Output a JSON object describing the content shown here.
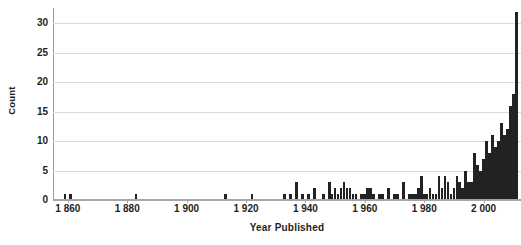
{
  "chart_data": {
    "type": "bar",
    "title": "",
    "xlabel": "Year Published",
    "ylabel": "Count",
    "grid": true,
    "legend": "none",
    "xlim": [
      1855,
      2012
    ],
    "ylim": [
      0,
      32
    ],
    "ytick_labels": [
      "0",
      "5",
      "10",
      "15",
      "20",
      "25",
      "30"
    ],
    "ytick_values": [
      0,
      5,
      10,
      15,
      20,
      25,
      30
    ],
    "xtick_labels": [
      "1 860",
      "1 880",
      "1 900",
      "1 920",
      "1 940",
      "1 960",
      "1 980",
      "2 000"
    ],
    "xtick_values": [
      1860,
      1880,
      1900,
      1920,
      1940,
      1960,
      1980,
      2000
    ],
    "bar_color": "#222222",
    "gridline_color": "#d9d9d9",
    "categories": [
      1858,
      1859,
      1860,
      1861,
      1862,
      1863,
      1864,
      1865,
      1866,
      1867,
      1868,
      1869,
      1870,
      1871,
      1872,
      1873,
      1874,
      1875,
      1876,
      1877,
      1878,
      1879,
      1880,
      1881,
      1882,
      1883,
      1884,
      1885,
      1886,
      1887,
      1888,
      1889,
      1890,
      1891,
      1892,
      1893,
      1894,
      1895,
      1896,
      1897,
      1898,
      1899,
      1900,
      1901,
      1902,
      1903,
      1904,
      1905,
      1906,
      1907,
      1908,
      1909,
      1910,
      1911,
      1912,
      1913,
      1914,
      1915,
      1916,
      1917,
      1918,
      1919,
      1920,
      1921,
      1922,
      1923,
      1924,
      1925,
      1926,
      1927,
      1928,
      1929,
      1930,
      1931,
      1932,
      1933,
      1934,
      1935,
      1936,
      1937,
      1938,
      1939,
      1940,
      1941,
      1942,
      1943,
      1944,
      1945,
      1946,
      1947,
      1948,
      1949,
      1950,
      1951,
      1952,
      1953,
      1954,
      1955,
      1956,
      1957,
      1958,
      1959,
      1960,
      1961,
      1962,
      1963,
      1964,
      1965,
      1966,
      1967,
      1968,
      1969,
      1970,
      1971,
      1972,
      1973,
      1974,
      1975,
      1976,
      1977,
      1978,
      1979,
      1980,
      1981,
      1982,
      1983,
      1984,
      1985,
      1986,
      1987,
      1988,
      1989,
      1990,
      1991,
      1992,
      1993,
      1994,
      1995,
      1996,
      1997,
      1998,
      1999,
      2000,
      2001,
      2002,
      2003,
      2004,
      2005,
      2006,
      2007,
      2008,
      2009,
      2010
    ],
    "values": [
      0,
      1,
      0,
      1,
      0,
      0,
      0,
      0,
      0,
      0,
      0,
      0,
      0,
      0,
      0,
      0,
      0,
      0,
      0,
      0,
      0,
      0,
      0,
      0,
      0,
      1,
      0,
      0,
      0,
      0,
      0,
      0,
      0,
      0,
      0,
      0,
      0,
      0,
      0,
      0,
      0,
      0,
      0,
      0,
      0,
      0,
      0,
      0,
      0,
      0,
      0,
      0,
      0,
      0,
      0,
      1,
      0,
      0,
      0,
      0,
      0,
      0,
      0,
      0,
      1,
      0,
      0,
      0,
      0,
      0,
      0,
      0,
      0,
      0,
      0,
      1,
      0,
      1,
      0,
      3,
      0,
      1,
      1,
      0,
      2,
      0,
      0,
      1,
      0,
      3,
      1,
      2,
      1,
      2,
      3,
      2,
      2,
      1,
      1,
      0,
      1,
      1,
      2,
      2,
      1,
      0,
      1,
      1,
      0,
      2,
      0,
      1,
      1,
      0,
      3,
      0,
      1,
      1,
      1,
      2,
      4,
      1,
      1,
      2,
      1,
      1,
      4,
      2,
      4,
      3,
      1,
      2,
      4,
      3,
      2,
      5,
      3,
      3,
      8,
      6,
      5,
      7,
      10,
      8,
      11,
      9,
      10,
      13,
      11,
      12,
      16,
      18,
      32
    ],
    "bars": [
      {
        "x": 1859,
        "v": 1
      },
      {
        "x": 1861,
        "v": 1
      },
      {
        "x": 1883,
        "v": 1
      },
      {
        "x": 1913,
        "v": 1
      },
      {
        "x": 1922,
        "v": 1
      },
      {
        "x": 1933,
        "v": 1
      },
      {
        "x": 1935,
        "v": 1
      },
      {
        "x": 1937,
        "v": 3
      },
      {
        "x": 1939,
        "v": 1
      },
      {
        "x": 1941,
        "v": 1
      },
      {
        "x": 1943,
        "v": 2
      },
      {
        "x": 1946,
        "v": 1
      },
      {
        "x": 1948,
        "v": 3
      },
      {
        "x": 1949,
        "v": 1
      },
      {
        "x": 1950,
        "v": 2
      },
      {
        "x": 1951,
        "v": 1
      },
      {
        "x": 1952,
        "v": 2
      },
      {
        "x": 1953,
        "v": 3
      },
      {
        "x": 1954,
        "v": 2
      },
      {
        "x": 1955,
        "v": 2
      },
      {
        "x": 1956,
        "v": 1
      },
      {
        "x": 1957,
        "v": 1
      },
      {
        "x": 1959,
        "v": 1
      },
      {
        "x": 1960,
        "v": 1
      },
      {
        "x": 1961,
        "v": 2
      },
      {
        "x": 1962,
        "v": 2
      },
      {
        "x": 1963,
        "v": 1
      },
      {
        "x": 1965,
        "v": 1
      },
      {
        "x": 1966,
        "v": 1
      },
      {
        "x": 1968,
        "v": 2
      },
      {
        "x": 1970,
        "v": 1
      },
      {
        "x": 1971,
        "v": 1
      },
      {
        "x": 1973,
        "v": 3
      },
      {
        "x": 1975,
        "v": 1
      },
      {
        "x": 1976,
        "v": 1
      },
      {
        "x": 1977,
        "v": 1
      },
      {
        "x": 1978,
        "v": 2
      },
      {
        "x": 1979,
        "v": 4
      },
      {
        "x": 1980,
        "v": 1
      },
      {
        "x": 1981,
        "v": 1
      },
      {
        "x": 1982,
        "v": 2
      },
      {
        "x": 1983,
        "v": 1
      },
      {
        "x": 1984,
        "v": 1
      },
      {
        "x": 1985,
        "v": 4
      },
      {
        "x": 1986,
        "v": 2
      },
      {
        "x": 1987,
        "v": 4
      },
      {
        "x": 1988,
        "v": 3
      },
      {
        "x": 1989,
        "v": 1
      },
      {
        "x": 1990,
        "v": 2
      },
      {
        "x": 1991,
        "v": 4
      },
      {
        "x": 1992,
        "v": 3
      },
      {
        "x": 1993,
        "v": 2
      },
      {
        "x": 1994,
        "v": 5
      },
      {
        "x": 1995,
        "v": 3
      },
      {
        "x": 1996,
        "v": 3
      },
      {
        "x": 1997,
        "v": 8
      },
      {
        "x": 1998,
        "v": 6
      },
      {
        "x": 1999,
        "v": 5
      },
      {
        "x": 2000,
        "v": 7
      },
      {
        "x": 2001,
        "v": 10
      },
      {
        "x": 2002,
        "v": 8
      },
      {
        "x": 2003,
        "v": 11
      },
      {
        "x": 2004,
        "v": 9
      },
      {
        "x": 2005,
        "v": 10
      },
      {
        "x": 2006,
        "v": 13
      },
      {
        "x": 2007,
        "v": 11
      },
      {
        "x": 2008,
        "v": 12
      },
      {
        "x": 2009,
        "v": 16
      },
      {
        "x": 2010,
        "v": 18
      },
      {
        "x": 2011,
        "v": 32
      }
    ]
  }
}
